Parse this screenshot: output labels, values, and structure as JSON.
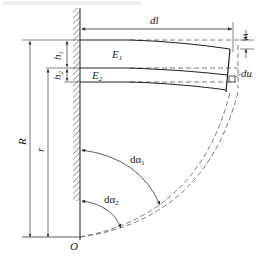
{
  "figure": {
    "caption_fragment": "",
    "labels": {
      "dl": "dl",
      "w": "w",
      "du": "du",
      "E1": "E",
      "E1_sub": "1",
      "E2": "E",
      "E2_sub": "2",
      "h1": "h",
      "h1_sub": "1",
      "h2": "h",
      "h2_sub": "2",
      "R": "R",
      "r": "r",
      "O": "O",
      "dalpha1": "dα",
      "dalpha1_sub": "1",
      "dalpha2": "dα",
      "dalpha2_sub": "2"
    },
    "colors": {
      "line": "#333333",
      "dashed": "#555555",
      "hatch": "#444444",
      "background": "#ffffff"
    }
  }
}
